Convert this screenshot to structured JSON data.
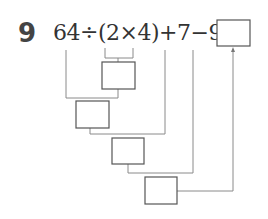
{
  "question": {
    "number": "9",
    "expression": "64÷(2×4)+7−9=",
    "answer_box": ""
  },
  "diagram": {
    "boxes": [
      {
        "id": "step1",
        "label": "",
        "operation": "2×4"
      },
      {
        "id": "step2",
        "label": "",
        "operation": "64÷step1"
      },
      {
        "id": "step3",
        "label": "",
        "operation": "step2+7"
      },
      {
        "id": "step4",
        "label": "",
        "operation": "step3−9"
      }
    ],
    "colors": {
      "line": "#888888",
      "box": "#555555",
      "text": "#333333"
    }
  }
}
